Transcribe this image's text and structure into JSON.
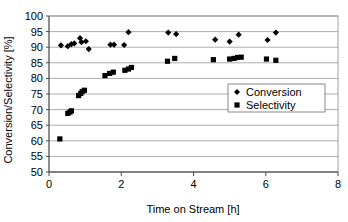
{
  "chart_data": {
    "type": "scatter",
    "title": "",
    "xlabel": "Time on Stream [h]",
    "ylabel": "Conversion/Selectivity [%]",
    "xlim": [
      0,
      8
    ],
    "ylim": [
      50,
      100
    ],
    "xticks": [
      0,
      2,
      4,
      6,
      8
    ],
    "yticks": [
      50,
      55,
      60,
      65,
      70,
      75,
      80,
      85,
      90,
      95,
      100
    ],
    "grid": "horizontal",
    "legend_position": "inside-right-lower",
    "series": [
      {
        "name": "Conversion",
        "marker": "diamond",
        "color": "#000000",
        "points": [
          [
            0.33,
            90.6
          ],
          [
            0.52,
            90.3
          ],
          [
            0.62,
            91.0
          ],
          [
            0.7,
            91.2
          ],
          [
            0.86,
            92.9
          ],
          [
            0.9,
            91.6
          ],
          [
            1.02,
            91.9
          ],
          [
            1.1,
            89.4
          ],
          [
            1.7,
            90.8
          ],
          [
            1.8,
            90.8
          ],
          [
            2.08,
            90.7
          ],
          [
            2.2,
            94.8
          ],
          [
            3.3,
            94.7
          ],
          [
            3.52,
            94.2
          ],
          [
            4.6,
            92.4
          ],
          [
            5.0,
            91.8
          ],
          [
            5.25,
            94.0
          ],
          [
            6.05,
            92.3
          ],
          [
            6.28,
            94.7
          ]
        ]
      },
      {
        "name": "Selectivity",
        "marker": "square",
        "color": "#000000",
        "points": [
          [
            0.3,
            60.6
          ],
          [
            0.52,
            68.8
          ],
          [
            0.58,
            69.2
          ],
          [
            0.62,
            69.6
          ],
          [
            0.82,
            74.5
          ],
          [
            0.88,
            75.2
          ],
          [
            0.92,
            75.8
          ],
          [
            0.98,
            76.2
          ],
          [
            1.55,
            80.9
          ],
          [
            1.68,
            81.6
          ],
          [
            1.78,
            82.0
          ],
          [
            2.1,
            82.6
          ],
          [
            2.2,
            83.0
          ],
          [
            2.28,
            83.5
          ],
          [
            3.28,
            85.5
          ],
          [
            3.48,
            86.4
          ],
          [
            4.55,
            86.0
          ],
          [
            5.0,
            86.2
          ],
          [
            5.12,
            86.4
          ],
          [
            5.22,
            86.7
          ],
          [
            5.32,
            86.8
          ],
          [
            6.02,
            86.2
          ],
          [
            6.28,
            85.8
          ]
        ]
      }
    ]
  },
  "legend": {
    "entries": [
      {
        "label": "Conversion",
        "marker": "diamond"
      },
      {
        "label": "Selectivity",
        "marker": "square"
      }
    ]
  },
  "axes": {
    "x_title": "Time on Stream [h]",
    "y_title": "Conversion/Selectivity [%]",
    "x_tick_labels": [
      "0",
      "2",
      "4",
      "6",
      "8"
    ],
    "y_tick_labels": [
      "50",
      "55",
      "60",
      "65",
      "70",
      "75",
      "80",
      "85",
      "90",
      "95",
      "100"
    ]
  }
}
